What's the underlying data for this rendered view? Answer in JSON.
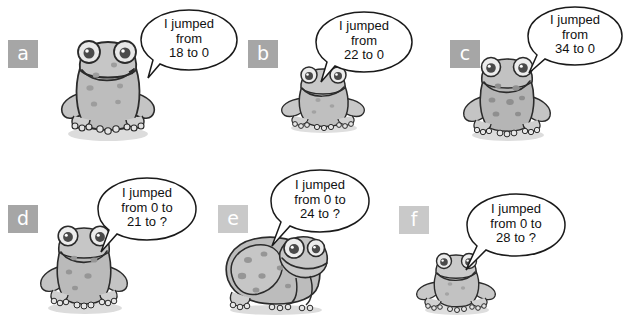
{
  "page": {
    "background_color": "#ffffff",
    "badge_color": "#a6a6a6",
    "badge_text_color": "#ffffff",
    "ink_color": "#1a1a1a",
    "frog_body_color": "#b8b8b8",
    "frog_shadow_color": "#d8d8d8"
  },
  "items": [
    {
      "id": "a",
      "label": "a",
      "lines": [
        "I jumped",
        "from",
        "18 to 0"
      ],
      "full_text": "I jumped from 18 to 0",
      "from": 18,
      "to": 0,
      "frog_pose": "front-large"
    },
    {
      "id": "b",
      "label": "b",
      "lines": [
        "I jumped",
        "from",
        "22 to 0"
      ],
      "full_text": "I jumped from 22 to 0",
      "from": 22,
      "to": 0,
      "frog_pose": "front-small"
    },
    {
      "id": "c",
      "label": "c",
      "lines": [
        "I jumped",
        "from",
        "34 to 0"
      ],
      "full_text": "I jumped from 34 to 0",
      "from": 34,
      "to": 0,
      "frog_pose": "front-spotted"
    },
    {
      "id": "d",
      "label": "d",
      "lines": [
        "I jumped",
        "from 0 to",
        "21 to ?"
      ],
      "full_text": "I jumped from 0 to 21 to ?",
      "from": 0,
      "to": 21,
      "next": "?",
      "frog_pose": "front-large"
    },
    {
      "id": "e",
      "label": "e",
      "lines": [
        "I jumped",
        "from 0 to",
        "24 to ?"
      ],
      "full_text": "I jumped from 0 to 24 to ?",
      "from": 0,
      "to": 24,
      "next": "?",
      "frog_pose": "side-profile"
    },
    {
      "id": "f",
      "label": "f",
      "lines": [
        "I jumped",
        "from 0 to",
        "28 to ?"
      ],
      "full_text": "I jumped from 0 to 28 to ?",
      "from": 0,
      "to": 28,
      "next": "?",
      "frog_pose": "front-tiny"
    }
  ]
}
